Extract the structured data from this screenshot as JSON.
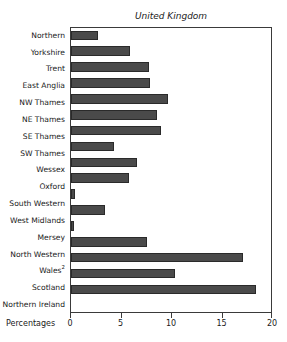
{
  "chart_data": {
    "type": "bar",
    "orientation": "horizontal",
    "title": "",
    "subtitle": "United Kingdom",
    "xlabel": "Percentages",
    "ylabel": "",
    "xlim": [
      0,
      20
    ],
    "xticks": [
      0,
      5,
      10,
      15,
      20
    ],
    "xtick_labels": [
      "0",
      "5",
      "10",
      "15",
      "20"
    ],
    "grid": false,
    "legend": null,
    "bar_color": "#4a4a4a",
    "bar_edge_color": "#2a2a2a",
    "frame_color": "#3a3a3a",
    "categories": [
      "Northern",
      "Yorkshire",
      "Trent",
      "East Anglia",
      "NW Thames",
      "NE Thames",
      "SE Thames",
      "SW Thames",
      "Wessex",
      "Oxford",
      "South Western",
      "West Midlands",
      "Mersey",
      "North Western",
      "Wales",
      "Scotland",
      "Northern Ireland"
    ],
    "category_footnotes": {
      "Wales": "2"
    },
    "values": [
      2.7,
      5.8,
      7.7,
      7.8,
      9.6,
      8.5,
      8.9,
      4.3,
      6.5,
      5.7,
      0.4,
      3.4,
      0.3,
      7.5,
      17.0,
      10.3,
      18.3
    ]
  },
  "axis": {
    "x_title": "Percentages"
  },
  "header": {
    "cropped_title": ""
  }
}
